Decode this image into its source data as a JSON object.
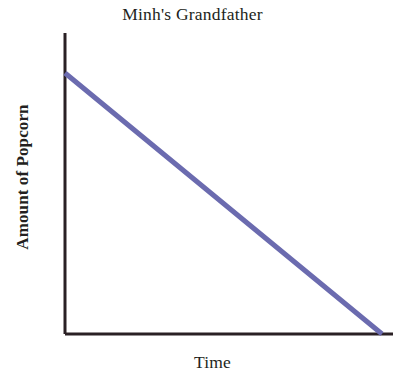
{
  "chart_data": {
    "type": "line",
    "title": "Minh's Grandfather",
    "xlabel": "Time",
    "ylabel": "Amount of Popcorn",
    "grid": false,
    "legend": false,
    "legend_position": "none",
    "xlim": [
      0,
      100
    ],
    "ylim": [
      0,
      100
    ],
    "x_tick_labels": [],
    "y_tick_labels": [],
    "series": [
      {
        "name": "Amount of Popcorn",
        "color": "#6b6baf",
        "line_width_px": 5,
        "trend": "linear decreasing",
        "x": [
          0,
          25,
          50,
          75,
          100
        ],
        "y": [
          100,
          75,
          50,
          25,
          0
        ]
      }
    ],
    "annotations": []
  },
  "axes": {
    "axis_color": "#2a2024",
    "axis_width_px": 3,
    "x_axis_start_px": [
      65,
      334
    ],
    "x_axis_end_px": [
      393,
      334
    ],
    "y_axis_start_px": [
      65,
      33
    ],
    "y_axis_end_px": [
      65,
      334
    ]
  },
  "canvas": {
    "background": "#ffffff",
    "width": 393,
    "height": 381
  }
}
